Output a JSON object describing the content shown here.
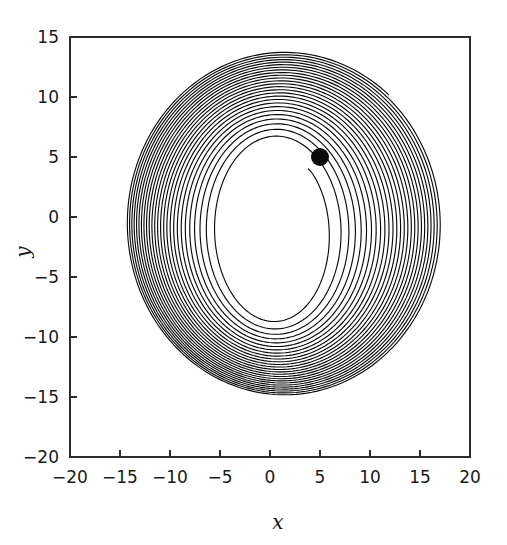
{
  "chart_data": {
    "type": "line",
    "title": "",
    "subtitle": "",
    "xlabel": "x",
    "ylabel": "y",
    "xlim": [
      -20,
      20
    ],
    "ylim": [
      -20,
      15
    ],
    "xticks": [
      -20,
      -15,
      -10,
      -5,
      0,
      5,
      10,
      15,
      20
    ],
    "xtick_labels": [
      "-20",
      "-15",
      "-10",
      "-5",
      "0",
      "5",
      "10",
      "15",
      "20"
    ],
    "yticks": [
      -20,
      -15,
      -10,
      -5,
      0,
      5,
      10,
      15
    ],
    "ytick_labels": [
      "-20",
      "-15",
      "-10",
      "-5",
      "0",
      "5",
      "10",
      "15"
    ],
    "grid": false,
    "legend": null,
    "series": [
      {
        "name": "trajectory",
        "description": "outward-spiralling phase-plane orbit converging to a limit cycle",
        "color": "#0a0a0a",
        "line_width": 1.15,
        "start_point": [
          5.0,
          5.0
        ],
        "spiral": {
          "center": [
            0.5,
            -1.2
          ],
          "start_angle_deg": 48,
          "turns": 26,
          "direction": "clockwise",
          "radius_start_x": 5.0,
          "radius_start_y": 7.0,
          "radius_end_x": 15.8,
          "radius_end_y": 14.3,
          "growth_exponent": 0.62,
          "lobe_amplitude": 0.075,
          "lobe_phase_deg": 35,
          "points_per_turn": 180
        },
        "extents": {
          "x_min": -14.6,
          "x_max": 16.3,
          "y_min": -15.4,
          "y_max": 13.2
        }
      }
    ],
    "markers": [
      {
        "name": "initial-condition",
        "x": 5.0,
        "y": 5.0,
        "radius_px": 9,
        "color": "#0a0a0a",
        "shape": "circle"
      }
    ]
  },
  "axes": {
    "frame_color": "#2b2b2b",
    "background": "#ffffff"
  }
}
